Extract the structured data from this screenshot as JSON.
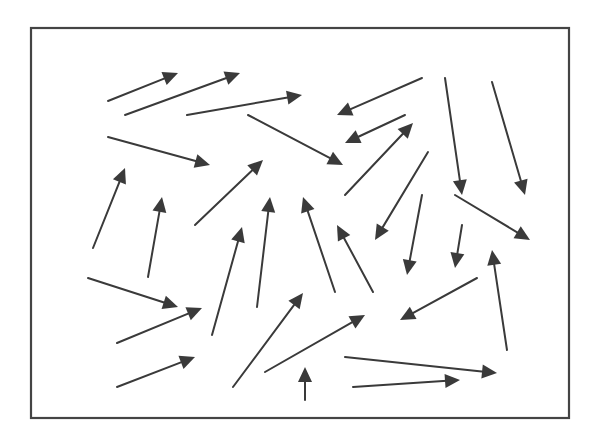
{
  "diagram": {
    "type": "vector-field-arrows",
    "colors": {
      "background": "#ffffff",
      "frame": "#444444",
      "arrow": "#3a3a3a"
    },
    "frame": {
      "x": 31,
      "y": 28,
      "width": 538,
      "height": 390
    },
    "arrows": [
      {
        "x1": 108,
        "y1": 101,
        "x2": 178,
        "y2": 73
      },
      {
        "x1": 125,
        "y1": 115,
        "x2": 240,
        "y2": 73
      },
      {
        "x1": 187,
        "y1": 115,
        "x2": 302,
        "y2": 95
      },
      {
        "x1": 108,
        "y1": 137,
        "x2": 210,
        "y2": 165
      },
      {
        "x1": 248,
        "y1": 115,
        "x2": 343,
        "y2": 165
      },
      {
        "x1": 422,
        "y1": 78,
        "x2": 337,
        "y2": 115
      },
      {
        "x1": 405,
        "y1": 115,
        "x2": 345,
        "y2": 143
      },
      {
        "x1": 345,
        "y1": 195,
        "x2": 413,
        "y2": 123
      },
      {
        "x1": 445,
        "y1": 78,
        "x2": 462,
        "y2": 195
      },
      {
        "x1": 492,
        "y1": 82,
        "x2": 525,
        "y2": 195
      },
      {
        "x1": 93,
        "y1": 248,
        "x2": 125,
        "y2": 168
      },
      {
        "x1": 148,
        "y1": 277,
        "x2": 162,
        "y2": 197
      },
      {
        "x1": 195,
        "y1": 225,
        "x2": 263,
        "y2": 160
      },
      {
        "x1": 88,
        "y1": 278,
        "x2": 178,
        "y2": 307
      },
      {
        "x1": 117,
        "y1": 343,
        "x2": 202,
        "y2": 308
      },
      {
        "x1": 117,
        "y1": 387,
        "x2": 195,
        "y2": 357
      },
      {
        "x1": 212,
        "y1": 335,
        "x2": 242,
        "y2": 227
      },
      {
        "x1": 257,
        "y1": 307,
        "x2": 270,
        "y2": 197
      },
      {
        "x1": 335,
        "y1": 292,
        "x2": 303,
        "y2": 197
      },
      {
        "x1": 373,
        "y1": 292,
        "x2": 337,
        "y2": 225
      },
      {
        "x1": 428,
        "y1": 152,
        "x2": 375,
        "y2": 240
      },
      {
        "x1": 422,
        "y1": 195,
        "x2": 407,
        "y2": 275
      },
      {
        "x1": 462,
        "y1": 225,
        "x2": 455,
        "y2": 268
      },
      {
        "x1": 455,
        "y1": 195,
        "x2": 530,
        "y2": 240
      },
      {
        "x1": 233,
        "y1": 387,
        "x2": 303,
        "y2": 293
      },
      {
        "x1": 265,
        "y1": 372,
        "x2": 365,
        "y2": 315
      },
      {
        "x1": 305,
        "y1": 400,
        "x2": 305,
        "y2": 367
      },
      {
        "x1": 477,
        "y1": 278,
        "x2": 400,
        "y2": 320
      },
      {
        "x1": 507,
        "y1": 350,
        "x2": 492,
        "y2": 250
      },
      {
        "x1": 345,
        "y1": 357,
        "x2": 497,
        "y2": 373
      },
      {
        "x1": 353,
        "y1": 387,
        "x2": 460,
        "y2": 380
      }
    ]
  }
}
